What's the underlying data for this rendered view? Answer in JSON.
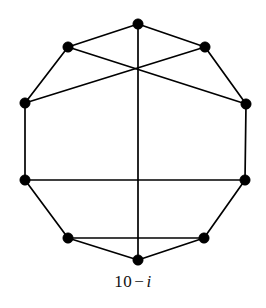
{
  "figure": {
    "name": "decagon-graph",
    "caption": {
      "number": "10",
      "operator": "−",
      "variable": "i",
      "full": "10 − i"
    },
    "colors": {
      "stroke": "#000000",
      "vertex_fill": "#000000",
      "background": "#ffffff"
    },
    "style": {
      "edge_width": 1.7,
      "vertex_radius": 5.2
    }
  },
  "graph_data": {
    "type": "graph",
    "shape": "decagon",
    "vertex_count": 10,
    "edge_count": 15,
    "vertices": [
      {
        "id": "v0",
        "label": "top",
        "x": 138,
        "y": 24
      },
      {
        "id": "v1",
        "label": "upper-right",
        "x": 205,
        "y": 47
      },
      {
        "id": "v2",
        "label": "right-upper",
        "x": 246,
        "y": 104
      },
      {
        "id": "v3",
        "label": "right",
        "x": 245,
        "y": 180
      },
      {
        "id": "v4",
        "label": "lower-right",
        "x": 204,
        "y": 238
      },
      {
        "id": "v5",
        "label": "bottom",
        "x": 138,
        "y": 260
      },
      {
        "id": "v6",
        "label": "lower-left",
        "x": 68,
        "y": 238
      },
      {
        "id": "v7",
        "label": "left",
        "x": 25,
        "y": 180
      },
      {
        "id": "v8",
        "label": "left-upper",
        "x": 25,
        "y": 103
      },
      {
        "id": "v9",
        "label": "upper-left",
        "x": 68,
        "y": 47
      }
    ],
    "edges": [
      {
        "from": "v0",
        "to": "v1",
        "kind": "perimeter"
      },
      {
        "from": "v1",
        "to": "v2",
        "kind": "perimeter"
      },
      {
        "from": "v2",
        "to": "v3",
        "kind": "perimeter"
      },
      {
        "from": "v3",
        "to": "v4",
        "kind": "perimeter"
      },
      {
        "from": "v4",
        "to": "v5",
        "kind": "perimeter"
      },
      {
        "from": "v5",
        "to": "v6",
        "kind": "perimeter"
      },
      {
        "from": "v6",
        "to": "v7",
        "kind": "perimeter"
      },
      {
        "from": "v7",
        "to": "v8",
        "kind": "perimeter"
      },
      {
        "from": "v8",
        "to": "v9",
        "kind": "perimeter"
      },
      {
        "from": "v9",
        "to": "v0",
        "kind": "perimeter"
      },
      {
        "from": "v0",
        "to": "v5",
        "kind": "chord"
      },
      {
        "from": "v7",
        "to": "v3",
        "kind": "chord"
      },
      {
        "from": "v8",
        "to": "v1",
        "kind": "chord"
      },
      {
        "from": "v9",
        "to": "v2",
        "kind": "chord"
      },
      {
        "from": "v6",
        "to": "v4",
        "kind": "chord"
      }
    ]
  }
}
